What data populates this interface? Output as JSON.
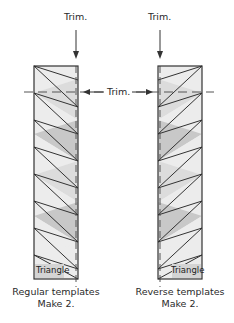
{
  "labels": {
    "trim_top_left": "Trim.",
    "trim_top_right": "Trim.",
    "trim_middle": "Trim."
  },
  "strips": [
    {
      "id": "regular",
      "caption_line1": "Regular templates",
      "caption_line2": "Make 2.",
      "corner_label": "Triangle",
      "x_left": 34,
      "x_right": 78,
      "y_top": 66,
      "y_bottom": 279,
      "trim_x": 76,
      "orientation": "down-right"
    },
    {
      "id": "reverse",
      "caption_line1": "Reverse templates",
      "caption_line2": "Make 2.",
      "corner_label": "Triangle",
      "x_left": 158,
      "x_right": 202,
      "y_top": 66,
      "y_bottom": 279,
      "trim_x": 160,
      "orientation": "down-left"
    }
  ],
  "trim_line_y": 92,
  "colors": {
    "outline": "#333333",
    "shade_light": "#ececec",
    "shade_mid": "#dcdcdc",
    "shade_dark": "#c8c8c8",
    "dash": "#555555",
    "background": "#ffffff"
  }
}
